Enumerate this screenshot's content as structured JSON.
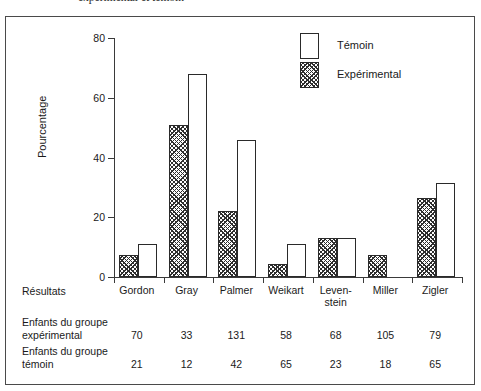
{
  "caption": "expérimental et témoin",
  "chart_data": {
    "type": "bar",
    "title": "",
    "xlabel": "",
    "ylabel": "Pourcentage",
    "ylim": [
      0,
      80
    ],
    "yticks": [
      "0",
      "20",
      "40",
      "60",
      "80"
    ],
    "grid": false,
    "legend_position": "top-right",
    "categories": [
      "Gordon",
      "Gray",
      "Palmer",
      "Weikart",
      "Leven-\nstein",
      "Miller",
      "Zigler"
    ],
    "series": [
      {
        "name": "Expérimental",
        "values": [
          7.5,
          51,
          22,
          4.5,
          13,
          7.5,
          26.5
        ]
      },
      {
        "name": "Témoin",
        "values": [
          11,
          68,
          46,
          11,
          13,
          null,
          31.5
        ]
      }
    ]
  },
  "legend": {
    "items": [
      {
        "label": "Témoin",
        "swatch": "outline-white"
      },
      {
        "label": "Expérimental",
        "swatch": "hatched"
      }
    ]
  },
  "table": {
    "results_label": "Résultats",
    "rows": [
      {
        "header": "Enfants du groupe\nexpérimental",
        "values": [
          "70",
          "33",
          "131",
          "58",
          "68",
          "105",
          "79"
        ]
      },
      {
        "header": "Enfants du groupe\ntémoin",
        "values": [
          "21",
          "12",
          "42",
          "65",
          "23",
          "18",
          "65"
        ]
      }
    ]
  },
  "colors": {
    "axis": "#3a3a3a",
    "bar_outline": "#2a2a2a",
    "hatch": "#2e2e2e",
    "frame": "#4a4a4a",
    "text": "#1a1a1a"
  }
}
